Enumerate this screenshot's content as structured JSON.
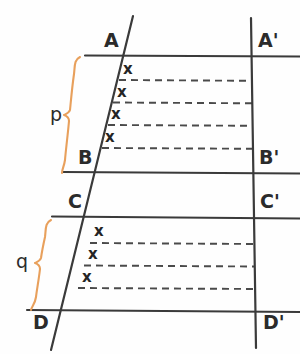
{
  "figure": {
    "background_color": "#fefefe",
    "line_color": "#3a3a3a",
    "dash_color": "#4a4a4a",
    "brace_color": "#e8a05c",
    "text_color": "#2b2b2b"
  },
  "points": {
    "a": "A",
    "a_prime": "A'",
    "b": "B",
    "b_prime": "B'",
    "c": "C",
    "c_prime": "C'",
    "d": "D",
    "d_prime": "D'"
  },
  "braces": {
    "p": "p",
    "q": "q"
  },
  "segments": {
    "p_marks": [
      "x",
      "x",
      "x",
      "x"
    ],
    "q_marks": [
      "x",
      "x",
      "x"
    ]
  },
  "geometry": {
    "transversal": {
      "x1": 133,
      "y1": 16,
      "x2": 51,
      "y2": 350
    },
    "right_line": {
      "x1": 251,
      "y1": 18,
      "x2": 256,
      "y2": 348
    },
    "horizontals": [
      {
        "name": "AA'",
        "y": 55,
        "x1": 85,
        "x2": 300
      },
      {
        "name": "BB'",
        "y": 172,
        "x1": 63,
        "x2": 300
      },
      {
        "name": "CC'",
        "y": 217,
        "x1": 52,
        "x2": 300
      },
      {
        "name": "DD'",
        "y": 310,
        "x1": 28,
        "x2": 300
      }
    ],
    "p_dashes": [
      80,
      102,
      125,
      148
    ],
    "q_dashes": [
      243,
      265,
      288
    ]
  }
}
